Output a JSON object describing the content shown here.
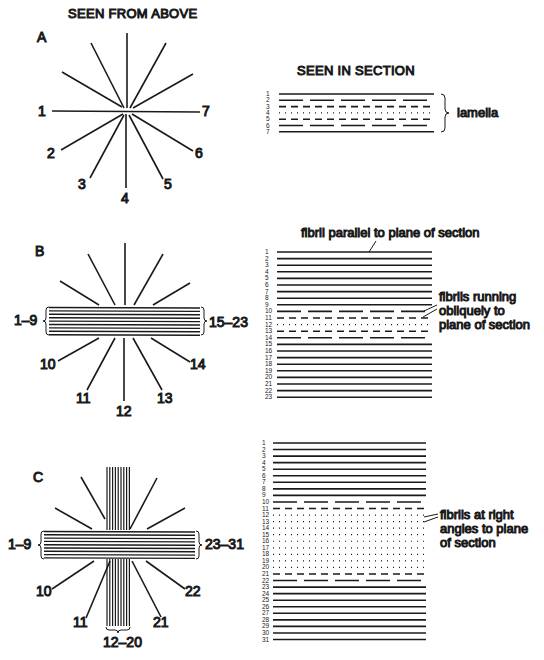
{
  "headers": {
    "left": "SEEN FROM ABOVE",
    "right": "SEEN IN SECTION"
  },
  "colors": {
    "ink": "#1a1a1a",
    "paper": "#ffffff"
  },
  "panels": [
    {
      "id": "A",
      "letter": "A",
      "star": {
        "center": [
          127,
          111
        ],
        "rays": [
          {
            "label": "1",
            "angle": 180
          },
          {
            "label": "2",
            "angle": 210
          },
          {
            "label": "3",
            "angle": 240
          },
          {
            "label": "4",
            "angle": 270
          },
          {
            "label": "5",
            "angle": 300
          },
          {
            "label": "6",
            "angle": 330
          },
          {
            "label": "7",
            "angle": 0
          }
        ]
      },
      "section": {
        "line_count": 7,
        "styles": [
          "solid",
          "longdash",
          "dash",
          "dot",
          "dash",
          "longdash",
          "solid"
        ],
        "bracket_label": "lamella"
      }
    },
    {
      "id": "B",
      "letter": "B",
      "star": {
        "bundle_left_label": "1–9",
        "bundle_right_label": "15–23",
        "ray_labels": [
          "10",
          "11",
          "12",
          "13",
          "14"
        ]
      },
      "section": {
        "line_count": 23,
        "styles_note": "1–9 solid, 10 long-dash, 11 dash, 12 dotted, 13 dash, 14 long-dash, 15–23 solid",
        "annotations": [
          "fibril parallel to plane of section",
          "fibrils running obliquely to plane of section"
        ],
        "annotation_lines": {
          "parallel": "fibril parallel to plane of section",
          "oblique_1": "fibrils running",
          "oblique_2": "obliquely to",
          "oblique_3": "plane of section"
        }
      }
    },
    {
      "id": "C",
      "letter": "C",
      "star": {
        "bundle_left_label": "1–9",
        "bundle_right_label": "23–31",
        "bundle_bottom_label": "12–20",
        "ray_labels": [
          "10",
          "11",
          "21",
          "22"
        ]
      },
      "section": {
        "line_count": 31,
        "styles_note": "1–9 solid, 10 long-dash, 11 dash, 12–20 dotted, 21 dash, 22 long-dash, 23–31 solid",
        "annotation_lines": {
          "right_1": "fibrils at right",
          "right_2": "angles to plane",
          "right_3": "of section"
        }
      }
    }
  ]
}
